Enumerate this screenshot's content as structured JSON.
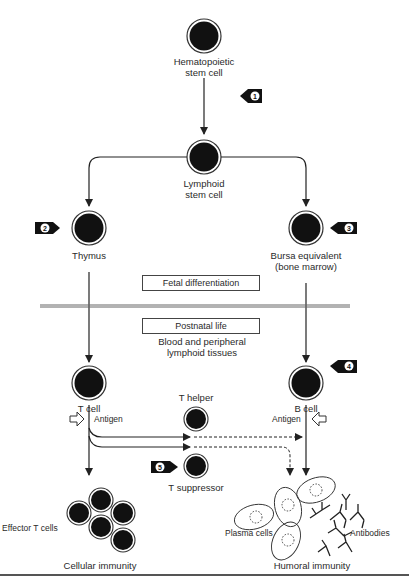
{
  "diagram": {
    "type": "flowchart",
    "nodes": {
      "hematopoietic": {
        "label_line1": "Hematopoietic",
        "label_line2": "stem cell"
      },
      "lymphoid": {
        "label_line1": "Lymphoid",
        "label_line2": "stem cell"
      },
      "thymus": {
        "label": "Thymus"
      },
      "bursa": {
        "label_line1": "Bursa equivalent",
        "label_line2": "(bone marrow)"
      },
      "tcell": {
        "label": "T cell"
      },
      "bcell": {
        "label": "B cell"
      },
      "thelper": {
        "label": "T helper"
      },
      "tsuppressor": {
        "label": "T suppressor"
      },
      "effector": {
        "label": "Effector T cells"
      },
      "plasma": {
        "label": "Plasma cells"
      },
      "antibodies": {
        "label": "Antibodies"
      }
    },
    "boxes": {
      "fetal": "Fetal differentiation",
      "postnatal": "Postnatal life"
    },
    "notes": {
      "blood_line1": "Blood and peripheral",
      "blood_line2": "lymphoid tissues"
    },
    "antigen_left": "Antigen",
    "antigen_right": "Antigen",
    "outcomes": {
      "cellular": "Cellular immunity",
      "humoral": "Humoral immunity"
    },
    "markers": [
      "1",
      "2",
      "3",
      "4",
      "5"
    ],
    "colors": {
      "cell_fill": "#111111",
      "line": "#333333",
      "background": "#ffffff"
    }
  }
}
